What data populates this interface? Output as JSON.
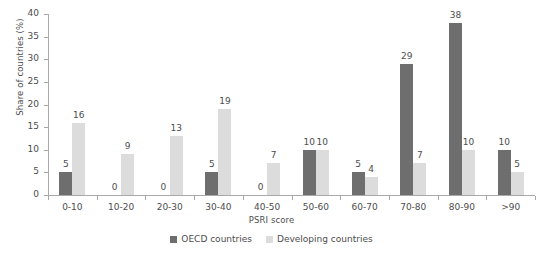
{
  "chart_data": {
    "type": "bar",
    "title": "",
    "xlabel": "PSRI score",
    "ylabel": "Share of countries (%)",
    "ylim": [
      0,
      40
    ],
    "yticks": [
      0,
      5,
      10,
      15,
      20,
      25,
      30,
      35,
      40
    ],
    "grid": false,
    "legend_position": "bottom-center",
    "categories": [
      "0-10",
      "10-20",
      "20-30",
      "30-40",
      "40-50",
      "50-60",
      "60-70",
      "70-80",
      "80-90",
      ">90"
    ],
    "series": [
      {
        "name": "OECD countries",
        "color": "#6e6e6e",
        "values": [
          5,
          0,
          0,
          5,
          0,
          10,
          5,
          29,
          38,
          10
        ]
      },
      {
        "name": "Developing countries",
        "color": "#dcdcdc",
        "values": [
          16,
          9,
          13,
          19,
          7,
          10,
          4,
          7,
          10,
          5
        ]
      }
    ]
  },
  "legend": {
    "items": [
      {
        "label": "OECD countries",
        "swatch": "oecd"
      },
      {
        "label": "Developing countries",
        "swatch": "devel"
      }
    ]
  },
  "axis": {
    "y_title": "Share of countries (%)",
    "x_title": "PSRI score"
  },
  "title_strip": {
    "text": ""
  }
}
